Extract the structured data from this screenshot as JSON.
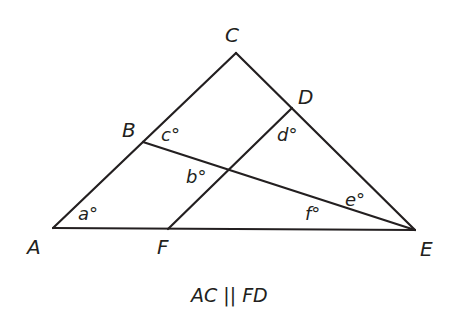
{
  "diagram": {
    "type": "geometry-triangle",
    "points": {
      "A": {
        "label": "A",
        "x": 53,
        "y": 228
      },
      "B": {
        "label": "B",
        "x": 143,
        "y": 142
      },
      "C": {
        "label": "C",
        "x": 236,
        "y": 53
      },
      "D": {
        "label": "D",
        "x": 292,
        "y": 108
      },
      "E": {
        "label": "E",
        "x": 415,
        "y": 230
      },
      "F": {
        "label": "F",
        "x": 168,
        "y": 229
      }
    },
    "segments": [
      "AC",
      "CE",
      "AE",
      "BE",
      "FD"
    ],
    "angles": {
      "a": "a°",
      "b": "b°",
      "c": "c°",
      "d": "d°",
      "e": "e°",
      "f": "f°"
    },
    "caption": "AC || FD",
    "stroke_color": "#231f20"
  }
}
